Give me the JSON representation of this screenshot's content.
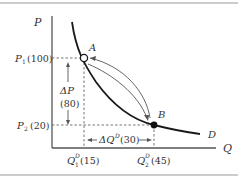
{
  "diagram": {
    "type": "demand-curve-elasticity",
    "axes": {
      "y_label": "P",
      "x_label": "Q"
    },
    "curve_label": "D",
    "points": {
      "A": {
        "label": "A",
        "style": "hollow"
      },
      "B": {
        "label": "B",
        "style": "filled"
      }
    },
    "price_labels": {
      "p1": {
        "symbol": "P",
        "sub": "1",
        "value": "(100)"
      },
      "p2": {
        "symbol": "P",
        "sub": "2",
        "value": "(20)"
      }
    },
    "quantity_labels": {
      "q1": {
        "symbol": "Q",
        "sup": "D",
        "sub": "1",
        "value": "(15)"
      },
      "q2": {
        "symbol": "Q",
        "sup": "D",
        "sub": "2",
        "value": "(45)"
      }
    },
    "delta_p": {
      "symbol": "ΔP",
      "value": "(80)"
    },
    "delta_q": {
      "symbol": "ΔQ",
      "sup": "D",
      "value": "(30)"
    }
  },
  "colors": {
    "line": "#1a1a1a",
    "axis": "#555555",
    "dashed": "#666666",
    "border": "#999999"
  }
}
